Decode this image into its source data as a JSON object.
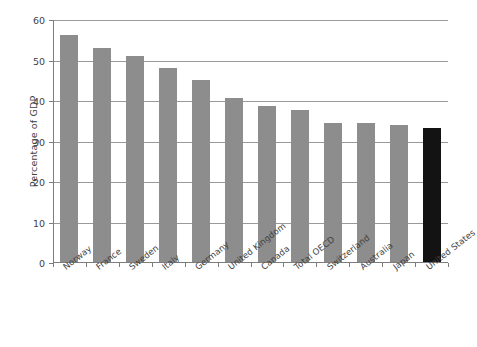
{
  "chart_data": {
    "type": "bar",
    "title": "",
    "subtitle": "",
    "xlabel": "",
    "ylabel": "Percentage of GDP",
    "ylim": [
      0,
      60
    ],
    "yticks": [
      0,
      10,
      20,
      30,
      40,
      50,
      60
    ],
    "ytick_labels": [
      "0",
      "10",
      "20",
      "30",
      "40",
      "50",
      "60"
    ],
    "grid": true,
    "grid_axis": "y",
    "legend": false,
    "legend_position": "none",
    "categories": [
      "Norway",
      "France",
      "Sweden",
      "Italy",
      "Germany",
      "United Kingdom",
      "Canada",
      "Total OECD",
      "Switzerland",
      "Australia",
      "Japan",
      "United States"
    ],
    "values": [
      56.3,
      53.1,
      51.1,
      48.1,
      45.2,
      40.7,
      38.7,
      37.8,
      34.6,
      34.5,
      34.0,
      33.4
    ],
    "bar_colors": [
      "#8d8d8d",
      "#8d8d8d",
      "#8d8d8d",
      "#8d8d8d",
      "#8d8d8d",
      "#8d8d8d",
      "#8d8d8d",
      "#8d8d8d",
      "#8d8d8d",
      "#8d8d8d",
      "#8d8d8d",
      "#131313"
    ],
    "highlight_category": "United States",
    "colors": {
      "bar_default": "#8d8d8d",
      "bar_highlight": "#131313",
      "gridline": "#9a9a9a",
      "axis": "#7d7d7d",
      "text": "#3f3f3f",
      "background": "#ffffff"
    }
  }
}
